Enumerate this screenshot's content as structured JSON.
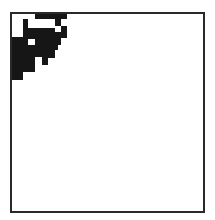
{
  "frame": {
    "border_color": "#2a2a2a",
    "fill_color": "#ffffff"
  },
  "pattern": {
    "color": "#161616",
    "blocks": [
      {
        "x": 35,
        "y": 14,
        "w": 32,
        "h": 5
      },
      {
        "x": 23,
        "y": 19,
        "w": 5,
        "h": 21
      },
      {
        "x": 55,
        "y": 19,
        "w": 6,
        "h": 7
      },
      {
        "x": 28,
        "y": 28,
        "w": 27,
        "h": 11
      },
      {
        "x": 35,
        "y": 39,
        "w": 20,
        "h": 6
      },
      {
        "x": 61,
        "y": 26,
        "w": 6,
        "h": 12
      },
      {
        "x": 55,
        "y": 32,
        "w": 6,
        "h": 13
      },
      {
        "x": 12,
        "y": 37,
        "w": 11,
        "h": 35
      },
      {
        "x": 23,
        "y": 40,
        "w": 5,
        "h": 32
      },
      {
        "x": 28,
        "y": 45,
        "w": 30,
        "h": 5
      },
      {
        "x": 28,
        "y": 50,
        "w": 7,
        "h": 22
      },
      {
        "x": 35,
        "y": 50,
        "w": 7,
        "h": 7
      },
      {
        "x": 42,
        "y": 50,
        "w": 13,
        "h": 8
      },
      {
        "x": 42,
        "y": 58,
        "w": 6,
        "h": 7
      },
      {
        "x": 12,
        "y": 72,
        "w": 11,
        "h": 8
      }
    ]
  }
}
